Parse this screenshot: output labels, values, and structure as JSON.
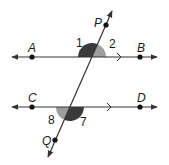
{
  "diagram": {
    "type": "parallel-lines-cut-by-transversal",
    "colors": {
      "line": "#333333",
      "dark_angle": "#3a3a3a",
      "light_angle": "#9e9e9e"
    },
    "lines": [
      {
        "name": "AB",
        "points": [
          "A",
          "B"
        ],
        "parallel_marker": true
      },
      {
        "name": "CD",
        "points": [
          "C",
          "D"
        ],
        "parallel_marker": true
      },
      {
        "name": "PQ",
        "points": [
          "P",
          "Q"
        ],
        "role": "transversal"
      }
    ],
    "point_labels": {
      "A": "A",
      "B": "B",
      "C": "C",
      "D": "D",
      "P": "P",
      "Q": "Q"
    },
    "angle_labels": {
      "a1": "1",
      "a2": "2",
      "a7": "7",
      "a8": "8"
    },
    "angles": [
      {
        "label": "1",
        "shade": "dark"
      },
      {
        "label": "2",
        "shade": "light"
      },
      {
        "label": "7",
        "shade": "dark"
      },
      {
        "label": "8",
        "shade": "light"
      }
    ]
  }
}
